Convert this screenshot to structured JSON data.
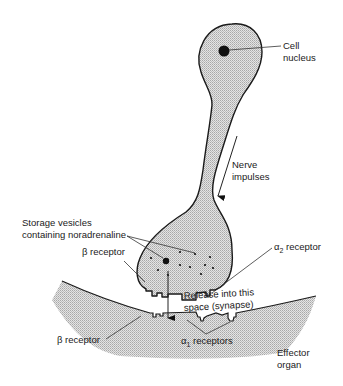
{
  "figure": {
    "type": "neuron-synapse-diagram",
    "colors": {
      "stroke": "#1a1a1a",
      "stipple_fill": "#cfcfcf",
      "background": "#ffffff"
    },
    "labels": {
      "cell_nucleus_line1": "Cell",
      "cell_nucleus_line2": "nucleus",
      "nerve_impulses_line1": "Nerve",
      "nerve_impulses_line2": "impulses",
      "storage_vesicles_line1": "Storage vesicles",
      "storage_vesicles_line2": "containing noradrenaline",
      "beta_receptor_presynaptic": "β receptor",
      "alpha2_receptor_symbol": "α",
      "alpha2_receptor_sub": "2",
      "alpha2_receptor_text": " receptor",
      "release_line1": "Release into this",
      "release_line2": "space (synapse)",
      "beta_receptor_effector": "β receptor",
      "alpha1_receptors_symbol": "α",
      "alpha1_receptors_sub": "1",
      "alpha1_receptors_text": " receptors",
      "effector_organ_line1": "Effector",
      "effector_organ_line2": "organ"
    }
  }
}
